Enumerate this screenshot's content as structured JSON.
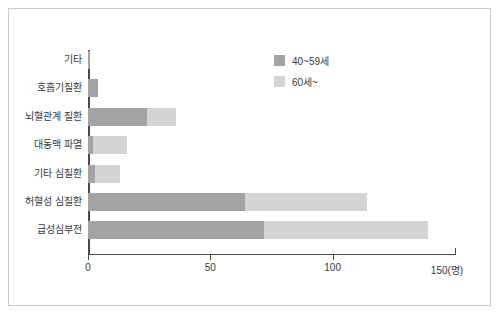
{
  "chart_data": {
    "type": "bar",
    "orientation": "horizontal",
    "stacked": true,
    "title": "",
    "xlabel": "150(명)",
    "ylabel": "",
    "xlim": [
      0,
      150
    ],
    "grid": false,
    "legend_position": "top-right",
    "categories": [
      "기타",
      "호흡기질환",
      "뇌혈관계 질환",
      "대동맥 파열",
      "기타 심질환",
      "허혈성 심질환",
      "급성심부전"
    ],
    "xticks": [
      "0",
      "50",
      "100",
      "150(명)"
    ],
    "xtick_values": [
      0,
      50,
      100,
      150
    ],
    "series": [
      {
        "name": "40~59세",
        "color": "#a3a3a3",
        "values": [
          1,
          4,
          24,
          2,
          3,
          64,
          72
        ]
      },
      {
        "name": "60세~",
        "color": "#d4d4d4",
        "values": [
          0,
          0,
          12,
          14,
          10,
          50,
          67
        ]
      }
    ],
    "totals": [
      1,
      4,
      36,
      16,
      13,
      114,
      139
    ]
  },
  "legend": {
    "items": [
      {
        "label": "40~59세",
        "color": "#a3a3a3"
      },
      {
        "label": "60세~",
        "color": "#d4d4d4"
      }
    ]
  },
  "axis": {
    "unit_label": "(명)"
  },
  "colors": {
    "frame": "#c9c9c9",
    "axis": "#4a4a4a",
    "series_40_59": "#a3a3a3",
    "series_60plus": "#d4d4d4",
    "text": "#3a3a3a",
    "background": "#ffffff"
  }
}
